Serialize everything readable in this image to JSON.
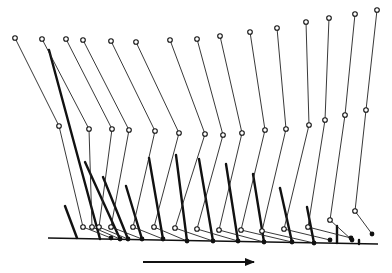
{
  "diagram": {
    "title": "",
    "colors": {
      "ink": "#111111",
      "background": "#ffffff"
    },
    "ground": {
      "x1": 48,
      "y1": 238,
      "x2": 378,
      "y2": 244
    },
    "direction_arrow": {
      "x1": 143,
      "y1": 262,
      "x2": 254,
      "y2": 262,
      "direction": "right"
    },
    "swing_leg_frames": [
      {
        "hip": [
          15,
          38
        ],
        "knee": [
          59,
          126
        ],
        "ankle": [
          83,
          227
        ],
        "toe": [
          111,
          238
        ]
      },
      {
        "hip": [
          42,
          39
        ],
        "knee": [
          89,
          129
        ],
        "ankle": [
          92,
          227
        ],
        "toe": [
          120,
          239
        ]
      },
      {
        "hip": [
          66,
          39
        ],
        "knee": [
          112,
          129
        ],
        "ankle": [
          99,
          227
        ],
        "toe": [
          128,
          239
        ]
      },
      {
        "hip": [
          83,
          40
        ],
        "knee": [
          129,
          130
        ],
        "ankle": [
          111,
          227
        ],
        "toe": [
          142,
          239
        ]
      },
      {
        "hip": [
          111,
          41
        ],
        "knee": [
          155,
          131
        ],
        "ankle": [
          133,
          227
        ],
        "toe": [
          163,
          239
        ]
      },
      {
        "hip": [
          136,
          42
        ],
        "knee": [
          179,
          133
        ],
        "ankle": [
          154,
          227
        ],
        "toe": [
          187,
          241
        ]
      },
      {
        "hip": [
          170,
          40
        ],
        "knee": [
          205,
          134
        ],
        "ankle": [
          175,
          228
        ],
        "toe": [
          213,
          241
        ]
      },
      {
        "hip": [
          197,
          39
        ],
        "knee": [
          223,
          135
        ],
        "ankle": [
          197,
          229
        ],
        "toe": [
          238,
          241
        ]
      },
      {
        "hip": [
          220,
          36
        ],
        "knee": [
          242,
          133
        ],
        "ankle": [
          219,
          230
        ],
        "toe": [
          264,
          242
        ]
      },
      {
        "hip": [
          250,
          32
        ],
        "knee": [
          265,
          130
        ],
        "ankle": [
          241,
          230
        ],
        "toe": [
          292,
          242
        ]
      },
      {
        "hip": [
          277,
          28
        ],
        "knee": [
          286,
          129
        ],
        "ankle": [
          262,
          231
        ],
        "toe": [
          314,
          243
        ]
      },
      {
        "hip": [
          306,
          22
        ],
        "knee": [
          309,
          125
        ],
        "ankle": [
          284,
          229
        ],
        "toe": [
          330,
          240
        ]
      },
      {
        "hip": [
          329,
          18
        ],
        "knee": [
          325,
          120
        ],
        "ankle": [
          308,
          227
        ],
        "toe": [
          351,
          238
        ]
      },
      {
        "hip": [
          355,
          14
        ],
        "knee": [
          345,
          115
        ],
        "ankle": [
          330,
          220
        ],
        "toe": [
          352,
          240
        ]
      },
      {
        "hip": [
          377,
          10
        ],
        "knee": [
          366,
          110
        ],
        "ankle": [
          355,
          211
        ],
        "toe": [
          372,
          234
        ]
      }
    ],
    "stance_leg_segments": [
      {
        "from": [
          65,
          206
        ],
        "to": [
          77,
          238
        ]
      },
      {
        "from": [
          49,
          50
        ],
        "to": [
          100,
          239
        ]
      },
      {
        "from": [
          85,
          162
        ],
        "to": [
          120,
          239
        ]
      },
      {
        "from": [
          103,
          177
        ],
        "to": [
          128,
          239
        ]
      },
      {
        "from": [
          126,
          186
        ],
        "to": [
          142,
          239
        ]
      },
      {
        "from": [
          149,
          158
        ],
        "to": [
          163,
          239
        ]
      },
      {
        "from": [
          176,
          155
        ],
        "to": [
          187,
          241
        ]
      },
      {
        "from": [
          199,
          159
        ],
        "to": [
          213,
          241
        ]
      },
      {
        "from": [
          226,
          164
        ],
        "to": [
          238,
          241
        ]
      },
      {
        "from": [
          253,
          174
        ],
        "to": [
          264,
          242
        ]
      },
      {
        "from": [
          280,
          188
        ],
        "to": [
          292,
          242
        ]
      },
      {
        "from": [
          307,
          207
        ],
        "to": [
          314,
          243
        ]
      },
      {
        "from": [
          337,
          226
        ],
        "to": [
          337,
          243
        ]
      },
      {
        "from": [
          359,
          240
        ],
        "to": [
          359,
          244
        ]
      }
    ]
  }
}
